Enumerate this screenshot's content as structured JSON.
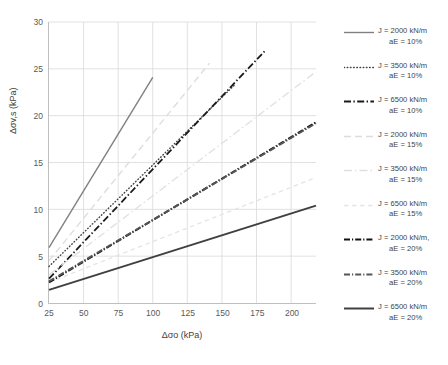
{
  "chart_data": {
    "type": "line",
    "title": "",
    "xlabel": "Δσo (kPa)",
    "ylabel": "Δσv,s (kPa)",
    "xlim": [
      25,
      218
    ],
    "ylim": [
      0,
      30
    ],
    "xticks": [
      25,
      50,
      75,
      100,
      125,
      150,
      175,
      200
    ],
    "yticks": [
      0,
      5,
      10,
      15,
      20,
      25,
      30
    ],
    "grid": true,
    "legend_position": "right",
    "series": [
      {
        "name": "J = 2000 kN/m aE = 10%",
        "J": 2000,
        "aE": "10%",
        "style": "solid",
        "color": "#808080",
        "width": 1.4,
        "x": [
          25,
          100
        ],
        "y": [
          5.9,
          24.1
        ]
      },
      {
        "name": "J = 3500 kN/m aE = 10%",
        "J": 3500,
        "aE": "10%",
        "style": "dotted",
        "color": "#404040",
        "width": 1.4,
        "x": [
          25,
          160
        ],
        "y": [
          3.9,
          23.4
        ]
      },
      {
        "name": "J = 6500 kN/m aE = 10%",
        "J": 6500,
        "aE": "10%",
        "style": "dashdot",
        "color": "#1a1a1a",
        "width": 1.8,
        "x": [
          25,
          181
        ],
        "y": [
          2.6,
          26.9
        ]
      },
      {
        "name": "J = 2000 kN/m aE = 15%",
        "J": 2000,
        "aE": "15%",
        "style": "dashed-long",
        "color": "#dcdcdc",
        "width": 1.3,
        "x": [
          25,
          141
        ],
        "y": [
          4.5,
          25.6
        ]
      },
      {
        "name": "J = 3500 kN/m aE = 15%",
        "J": 3500,
        "aE": "15%",
        "style": "dashdot-light",
        "color": "#e0e0e0",
        "width": 1.3,
        "x": [
          25,
          218
        ],
        "y": [
          3.0,
          24.7
        ]
      },
      {
        "name": "J = 6500 kN/m aE = 15%",
        "J": 6500,
        "aE": "15%",
        "style": "dashed-short",
        "color": "#e4e4e4",
        "width": 1.3,
        "x": [
          25,
          218
        ],
        "y": [
          2.2,
          13.4
        ]
      },
      {
        "name": "J = 2000 kN/m, aE = 20%",
        "J": 2000,
        "aE": "20%",
        "style": "dashdot-heavy",
        "color": "#111111",
        "width": 2.0,
        "x": [
          25,
          218
        ],
        "y": [
          2.2,
          19.3
        ]
      },
      {
        "name": "J = 3500 kN/m aE = 20%",
        "J": 3500,
        "aE": "20%",
        "style": "dashdot-heavy-gray",
        "color": "#555555",
        "width": 2.0,
        "x": [
          25,
          218
        ],
        "y": [
          2.3,
          19.2
        ]
      },
      {
        "name": "J = 6500 kN/m aE = 20%",
        "J": 6500,
        "aE": "20%",
        "style": "solid-heavy",
        "color": "#404040",
        "width": 2.0,
        "x": [
          25,
          218
        ],
        "y": [
          1.4,
          10.4
        ]
      }
    ]
  },
  "axes": {
    "y_title": "Δσv,s (kPa)",
    "x_title": "Δσo (kPa)",
    "y_tick_labels": [
      "0",
      "5",
      "10",
      "15",
      "20",
      "25",
      "30"
    ],
    "x_tick_labels": [
      "25",
      "50",
      "75",
      "100",
      "125",
      "150",
      "175",
      "200"
    ]
  },
  "legend": {
    "items": [
      {
        "line1": "J = 2000 kN/m",
        "line2": "aE = 10%"
      },
      {
        "line1": "J = 3500 kN/m",
        "line2": "aE = 10%"
      },
      {
        "line1": "J = 6500 kN/m",
        "line2": "aE = 10%"
      },
      {
        "line1": "J = 2000 kN/m",
        "line2": "aE = 15%"
      },
      {
        "line1": "J = 3500 kN/m",
        "line2": "aE = 15%"
      },
      {
        "line1": "J = 6500 kN/m",
        "line2": "aE = 15%"
      },
      {
        "line1": "J = 2000 kN/m,",
        "line2": "aE = 20%"
      },
      {
        "line1": "J = 3500 kN/m",
        "line2": "aE = 20%"
      },
      {
        "line1": "J = 6500 kN/m",
        "line2": "aE = 20%"
      }
    ]
  },
  "colors": {
    "grid": "#d9d9d9",
    "axis": "#bfbfbf",
    "text": "#404040",
    "background": "#ffffff"
  }
}
